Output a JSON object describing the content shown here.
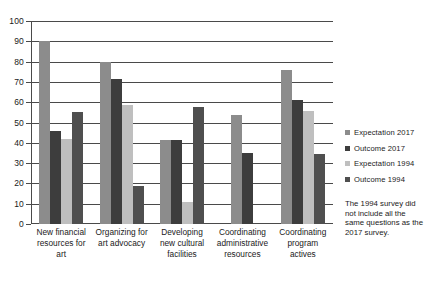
{
  "chart_data": {
    "type": "bar",
    "title": "",
    "xlabel": "",
    "ylabel": "",
    "ylim": [
      0,
      100
    ],
    "yticks": [
      0,
      10,
      20,
      30,
      40,
      50,
      60,
      70,
      80,
      90,
      100
    ],
    "grid": true,
    "legend_position": "right",
    "categories": [
      "New financial resources for art",
      "Organizing for art advocacy",
      "Developing new cultural facilities",
      "Coordinating administrative resources",
      "Coordinating program actives"
    ],
    "series": [
      {
        "name": "Expectation 2017",
        "color": "#8c8c8c",
        "values": [
          90,
          80,
          41.5,
          53.5,
          76
        ]
      },
      {
        "name": "Outcome 2017",
        "color": "#3d3d3d",
        "values": [
          46,
          71.5,
          41.5,
          35,
          61
        ]
      },
      {
        "name": "Expectation 1994",
        "color": "#bfbfbf",
        "values": [
          42,
          58.5,
          11,
          null,
          55.5
        ]
      },
      {
        "name": "Outcome 1994",
        "color": "#4f4f4f",
        "values": [
          55,
          18.5,
          57.5,
          null,
          34.5
        ]
      }
    ],
    "annotation": "The 1994 survey did not include all the same questions as the 2017 survey."
  }
}
